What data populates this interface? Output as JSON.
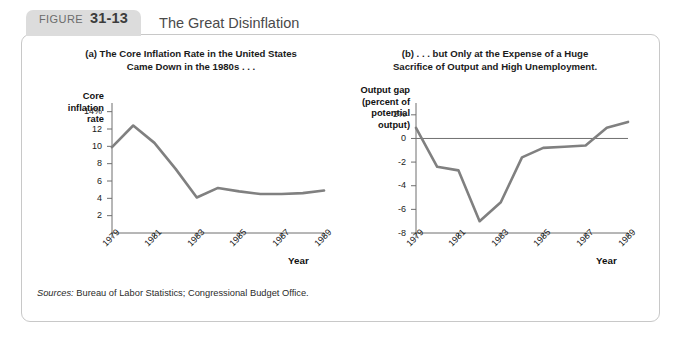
{
  "figure": {
    "badge_word": "FIGURE",
    "badge_number": "31-13",
    "title": "The Great Disinflation",
    "sources_label": "Sources:",
    "sources_text": "Bureau of Labor Statistics; Congressional Budget Office.",
    "line_color": "#808080",
    "axis_color": "#6f6f6f",
    "badge_color": "#dcdcdc",
    "panel_border_color": "#c8c8c8"
  },
  "chart_data": [
    {
      "id": "a",
      "type": "line",
      "title": "(a) The Core Inflation Rate in the United States Came Down in the 1980s . . .",
      "title_line1": "(a) The Core Inflation Rate in the United States",
      "title_line2": "Came Down in the 1980s . . .",
      "ylabel": "Core inflation rate",
      "ylabel_lines": [
        "Core",
        "inflation",
        "rate"
      ],
      "xlabel": "Year",
      "ytick_labels": [
        "14%",
        "12",
        "10",
        "8",
        "6",
        "4",
        "2"
      ],
      "ytick_values": [
        14,
        12,
        10,
        8,
        6,
        4,
        2
      ],
      "ylim": [
        0,
        15
      ],
      "xtick_labels": [
        "1979",
        "1981",
        "1983",
        "1985",
        "1987",
        "1989"
      ],
      "xtick_values": [
        1979,
        1981,
        1983,
        1985,
        1987,
        1989
      ],
      "xlim": [
        1979,
        1989
      ],
      "grid": false,
      "legend": "none",
      "x": [
        1979,
        1980,
        1981,
        1982,
        1983,
        1984,
        1985,
        1986,
        1987,
        1988,
        1989
      ],
      "values": [
        9.9,
        12.4,
        10.4,
        7.4,
        4.1,
        5.2,
        4.8,
        4.5,
        4.5,
        4.6,
        4.9
      ]
    },
    {
      "id": "b",
      "type": "line",
      "title": "(b) . . . but Only at the Expense of a Huge Sacrifice of Output and High Unemployment.",
      "title_line1": "(b) . . . but Only at the Expense of a Huge",
      "title_line2": "Sacrifice of Output and High Unemployment.",
      "ylabel": "Output gap (percent of potential output)",
      "ylabel_lines": [
        "Output gap",
        "(percent of",
        "potential",
        "output)"
      ],
      "xlabel": "Year",
      "ytick_labels": [
        "2%",
        "0",
        "-2",
        "-4",
        "-6",
        "-8"
      ],
      "ytick_values": [
        2,
        0,
        -2,
        -4,
        -6,
        -8
      ],
      "ylim": [
        -8,
        3
      ],
      "xtick_labels": [
        "1979",
        "1981",
        "1983",
        "1985",
        "1987",
        "1989"
      ],
      "xtick_values": [
        1979,
        1981,
        1983,
        1985,
        1987,
        1989
      ],
      "grid": false,
      "legend": "none",
      "zero_line": true,
      "xlim": [
        1979,
        1989
      ],
      "x": [
        1979,
        1980,
        1981,
        1982,
        1983,
        1984,
        1985,
        1986,
        1987,
        1988,
        1989
      ],
      "values": [
        0.9,
        -2.4,
        -2.7,
        -7.0,
        -5.4,
        -1.6,
        -0.8,
        -0.7,
        -0.6,
        0.9,
        1.4
      ]
    }
  ]
}
